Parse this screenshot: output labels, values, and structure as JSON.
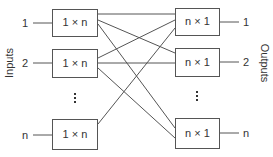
{
  "diagram": {
    "type": "switch-fabric",
    "side_labels": {
      "inputs": "Inputs",
      "outputs": "Outputs"
    },
    "input_ports": [
      "1",
      "2",
      "n"
    ],
    "output_ports": [
      "1",
      "2",
      "n"
    ],
    "input_switches": [
      "1 × n",
      "1 × n",
      "1 × n"
    ],
    "output_switches": [
      "n × 1",
      "n × 1",
      "n × 1"
    ],
    "ellipsis": "⋮",
    "colors": {
      "line": "#555555",
      "text": "#333333",
      "background": "#ffffff"
    }
  }
}
